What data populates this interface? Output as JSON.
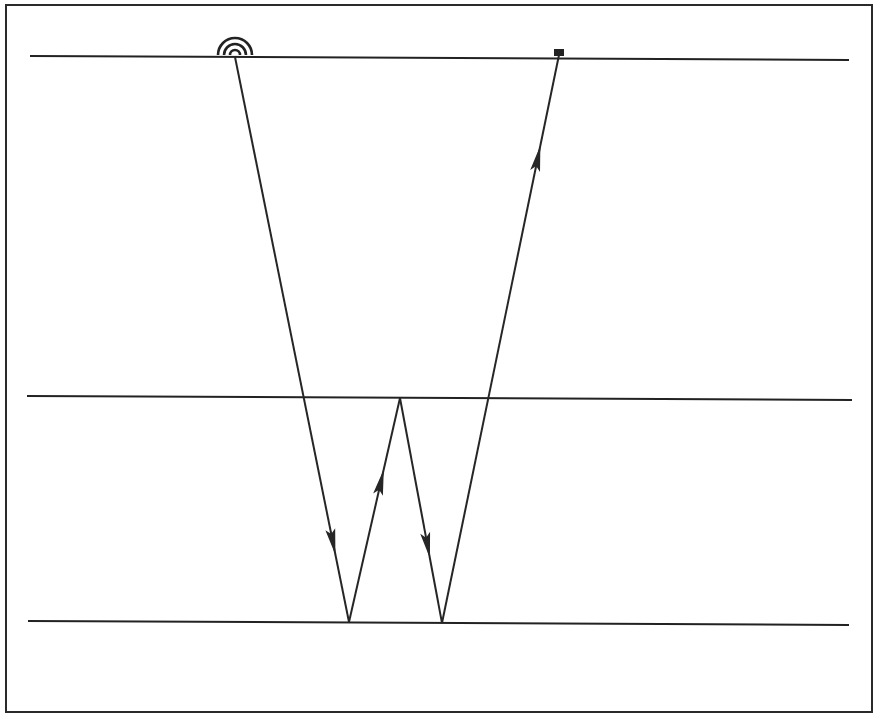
{
  "diagram": {
    "type": "seismic-ray-path",
    "frame": {
      "x": 6,
      "y": 5,
      "width": 866,
      "height": 707
    },
    "colors": {
      "line": "#222222",
      "background": "#ffffff"
    },
    "horizons": [
      {
        "name": "surface",
        "x1": 30,
        "y1": 56,
        "x2": 849,
        "y2": 60
      },
      {
        "name": "middle-horizon",
        "x1": 27,
        "y1": 396,
        "x2": 852,
        "y2": 400
      },
      {
        "name": "deep-horizon",
        "x1": 28,
        "y1": 621,
        "x2": 849,
        "y2": 625
      }
    ],
    "source": {
      "label": "source-icon",
      "x": 235,
      "y": 57
    },
    "receiver": {
      "label": "receiver-icon",
      "x": 559,
      "y": 54
    },
    "ray_points": [
      [
        235,
        57
      ],
      [
        349,
        622
      ],
      [
        400,
        398
      ],
      [
        442,
        623
      ],
      [
        559,
        55
      ]
    ],
    "arrows": [
      {
        "segment": 0,
        "t": 0.86,
        "direction": "down"
      },
      {
        "segment": 1,
        "t": 0.63,
        "direction": "up"
      },
      {
        "segment": 2,
        "t": 0.66,
        "direction": "down"
      },
      {
        "segment": 3,
        "t": 0.82,
        "direction": "up"
      }
    ]
  }
}
